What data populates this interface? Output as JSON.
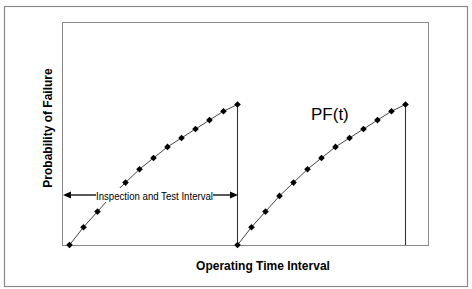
{
  "chart_data": {
    "type": "line",
    "title": "",
    "xlabel": "Operating Time Interval",
    "ylabel": "Probability of Failure",
    "annotations": [
      {
        "text": "PF(t)",
        "kind": "curve-label"
      },
      {
        "text": "Inspection and Test Interval",
        "kind": "double-arrow",
        "span": [
          0,
          12
        ]
      }
    ],
    "grid": false,
    "legend": "none",
    "xlim": [
      0,
      26
    ],
    "ylim": [
      0,
      1.0
    ],
    "x_ticks": [],
    "y_ticks": [],
    "series": [
      {
        "name": "PF(t) interval 1",
        "x": [
          0,
          1,
          2,
          3,
          4,
          5,
          6,
          7,
          8,
          9,
          10,
          11,
          12
        ],
        "values": [
          0.0,
          0.08,
          0.15,
          0.22,
          0.28,
          0.34,
          0.39,
          0.44,
          0.48,
          0.52,
          0.56,
          0.6,
          0.63
        ],
        "marker": "diamond",
        "drop_line_at_end": true
      },
      {
        "name": "PF(t) interval 2",
        "x": [
          12,
          13,
          14,
          15,
          16,
          17,
          18,
          19,
          20,
          21,
          22,
          23,
          24
        ],
        "values": [
          0.0,
          0.08,
          0.15,
          0.22,
          0.28,
          0.34,
          0.39,
          0.44,
          0.48,
          0.52,
          0.56,
          0.6,
          0.63
        ],
        "marker": "diamond",
        "drop_line_at_end": true
      }
    ],
    "colors": {
      "line": "#444444",
      "marker": "#000000",
      "frame": "#808080",
      "text": "#000000"
    }
  },
  "labels": {
    "x_axis": "Operating Time Interval",
    "y_axis": "Probability of Failure",
    "curve": "PF(t)",
    "interval": "Inspection and Test Interval"
  }
}
